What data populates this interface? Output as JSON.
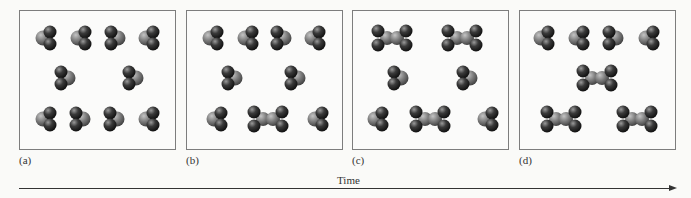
{
  "figure": {
    "panels": [
      {
        "label": "(a)",
        "monomers": 10,
        "dimers": 0
      },
      {
        "label": "(b)",
        "monomers": 8,
        "dimers": 1
      },
      {
        "label": "(c)",
        "monomers": 6,
        "dimers": 3
      },
      {
        "label": "(d)",
        "monomers": 4,
        "dimers": 3
      }
    ],
    "axis_label": "Time",
    "colors": {
      "atom_dark": "#2e2e2e",
      "atom_light": "#8a8a8a",
      "frame": "#7d7d7d",
      "background": "#fafaf8"
    }
  }
}
